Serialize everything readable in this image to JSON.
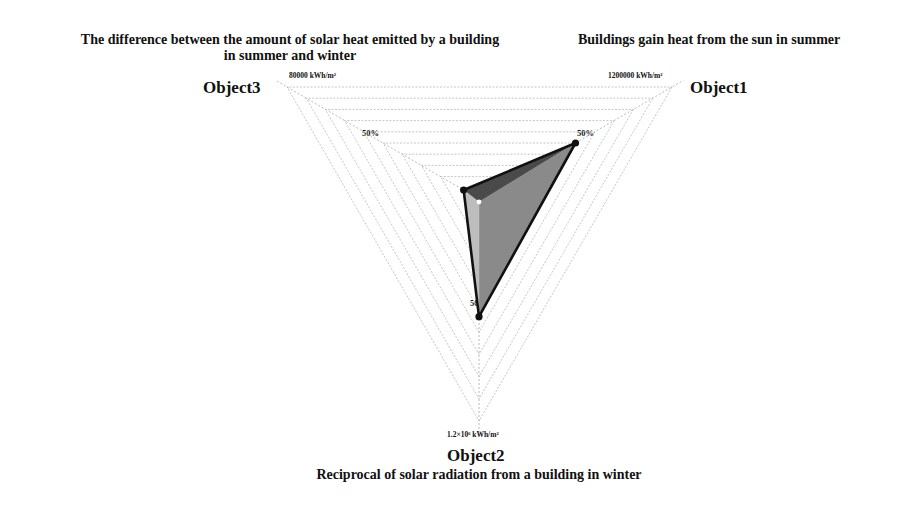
{
  "chart_data": {
    "type": "radar",
    "title": "",
    "axes": [
      {
        "key": "Object1",
        "name": "Object1",
        "description": "Buildings gain heat from the sun in summer",
        "max_label": "1200000 kWh/m²",
        "mid_label": "50%"
      },
      {
        "key": "Object2",
        "name": "Object2",
        "description": "Reciprocal of solar radiation from a building in winter",
        "max_label": "1.2×10⁶ kWh/m²",
        "mid_label": "50%"
      },
      {
        "key": "Object3",
        "name": "Object3",
        "description_line1": "The difference between the amount of solar heat emitted by a building",
        "description_line2": "in summer and winter",
        "max_label": "80000 kWh/m²",
        "mid_label": "50%"
      }
    ],
    "grid_levels": 10,
    "range_percent": [
      0,
      100
    ],
    "series": [
      {
        "name": "Building",
        "values_percent": {
          "Object1": 50,
          "Object2": 53,
          "Object3": 8
        }
      }
    ],
    "legend": "none",
    "grid": true
  },
  "labels": {
    "obj1_desc": "Buildings gain heat from the sun in summer",
    "obj3_desc_1": "The difference between the amount of solar heat emitted by a building",
    "obj3_desc_2": "in summer and winter",
    "obj2_desc": "Reciprocal of solar radiation from a building in winter",
    "obj1": "Object1",
    "obj2": "Object2",
    "obj3": "Object3",
    "obj1_max": "1200000 kWh/m²",
    "obj3_max": "80000 kWh/m²",
    "obj2_max": "1.2×10⁶ kWh/m²",
    "pct50": "50%"
  },
  "colors": {
    "grid": "#b8b8b8",
    "outline": "#111111",
    "face_top": "#4a4a4a",
    "face_right": "#8a8a8a",
    "face_left": "#bdbdbd"
  }
}
